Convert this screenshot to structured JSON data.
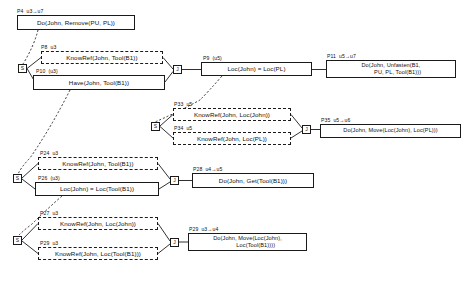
{
  "diagram": {
    "type": "plan-decomposition-graph",
    "colors": {
      "line": "#1a1a1a",
      "text": "#111111",
      "background": "#ffffff"
    },
    "nodes": [
      {
        "id": "p4",
        "tag": "P4  u3→u7",
        "text": "Do(John, Remove(PU, PL))",
        "style": "solid",
        "x": 17,
        "y": 15,
        "w": 118,
        "h": 15
      },
      {
        "id": "p8",
        "tag": "P8  u3",
        "text": "KnowRef(John, Tool(B1))",
        "style": "dashed",
        "x": 41,
        "y": 51,
        "w": 122,
        "h": 13
      },
      {
        "id": "p10",
        "tag": "P10  (u3)",
        "text": "Have(John, Tool(B1))",
        "style": "solid",
        "x": 33,
        "y": 75,
        "w": 132,
        "h": 15
      },
      {
        "id": "p9",
        "tag": "P9  (u5)",
        "text": "Loc(John) = Loc(PL)",
        "style": "solid",
        "x": 201,
        "y": 62,
        "w": 111,
        "h": 14
      },
      {
        "id": "p11",
        "tag": "P11  u5→u7",
        "text": "Do(John, Unfasten(B1,\n        PU, PL, Tool(B1)))",
        "style": "solid",
        "x": 326,
        "y": 60,
        "w": 130,
        "h": 18
      },
      {
        "id": "p33",
        "tag": "P33  u5",
        "text": "KnowRef(John, Loc(John))",
        "style": "dashed",
        "x": 173,
        "y": 108,
        "w": 118,
        "h": 13
      },
      {
        "id": "p34",
        "tag": "P34  u5",
        "text": "KnowRef(John, Loc(PL))",
        "style": "dashed",
        "x": 173,
        "y": 132,
        "w": 118,
        "h": 13
      },
      {
        "id": "p35",
        "tag": "P35  u5→u6",
        "text": "Do(John, Move(Loc(John), Loc(PL)))",
        "style": "solid",
        "x": 320,
        "y": 124,
        "w": 141,
        "h": 14
      },
      {
        "id": "p24",
        "tag": "P24  u3",
        "text": "KnowRef(John, Tool(B1))",
        "style": "dashed",
        "x": 38,
        "y": 157,
        "w": 120,
        "h": 13
      },
      {
        "id": "p26",
        "tag": "P26  (u3)",
        "text": "Loc(John) = Loc(Tool(B1))",
        "style": "solid",
        "x": 35,
        "y": 182,
        "w": 124,
        "h": 14
      },
      {
        "id": "p28",
        "tag": "P28  u4→u5",
        "text": "Do(John, Get(Tool(B1)))",
        "style": "solid",
        "x": 192,
        "y": 173,
        "w": 122,
        "h": 15
      },
      {
        "id": "p27",
        "tag": "P27  u3",
        "text": "KnowRef(John, Loc(John))",
        "style": "dashed",
        "x": 38,
        "y": 217,
        "w": 120,
        "h": 13
      },
      {
        "id": "p29b",
        "tag": "P29  u3",
        "text": "KnowRef(John, Loc(Tool(B1)))",
        "style": "dashed",
        "x": 38,
        "y": 247,
        "w": 120,
        "h": 13
      },
      {
        "id": "p29",
        "tag": "P29  u3→u4",
        "text": "Do(John, Move(Loc(John),\n          Loc(Tool(B1))))",
        "style": "solid",
        "x": 188,
        "y": 233,
        "w": 119,
        "h": 18
      }
    ],
    "junctions": [
      {
        "id": "s1",
        "label": "S",
        "x": 18,
        "y": 64
      },
      {
        "id": "j1",
        "label": "J",
        "x": 173,
        "y": 65
      },
      {
        "id": "s2",
        "label": "S",
        "x": 151,
        "y": 122
      },
      {
        "id": "j2",
        "label": "J",
        "x": 302,
        "y": 125
      },
      {
        "id": "s3",
        "label": "S",
        "x": 13,
        "y": 174
      },
      {
        "id": "j3",
        "label": "J",
        "x": 170,
        "y": 176
      },
      {
        "id": "s4",
        "label": "S",
        "x": 13,
        "y": 236
      },
      {
        "id": "j4",
        "label": "J",
        "x": 170,
        "y": 238
      }
    ]
  }
}
